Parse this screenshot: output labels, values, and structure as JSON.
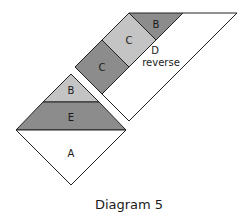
{
  "diagram": {
    "caption": "Diagram 5",
    "colors": {
      "dark": "#8c8c8c",
      "light": "#c4c4c4",
      "white": "#ffffff",
      "stroke": "#222222"
    },
    "upper_unit": {
      "pieces": [
        {
          "id": "B-top",
          "label": "B",
          "shade": "dark"
        },
        {
          "id": "C-light",
          "label": "C",
          "shade": "light"
        },
        {
          "id": "C-dark",
          "label": "C",
          "shade": "dark"
        },
        {
          "id": "D",
          "label": "D",
          "sublabel": "reverse",
          "shade": "white"
        }
      ]
    },
    "lower_unit": {
      "pieces": [
        {
          "id": "B-bottom",
          "label": "B",
          "shade": "light"
        },
        {
          "id": "E",
          "label": "E",
          "shade": "dark"
        },
        {
          "id": "A",
          "label": "A",
          "shade": "white"
        }
      ]
    }
  }
}
